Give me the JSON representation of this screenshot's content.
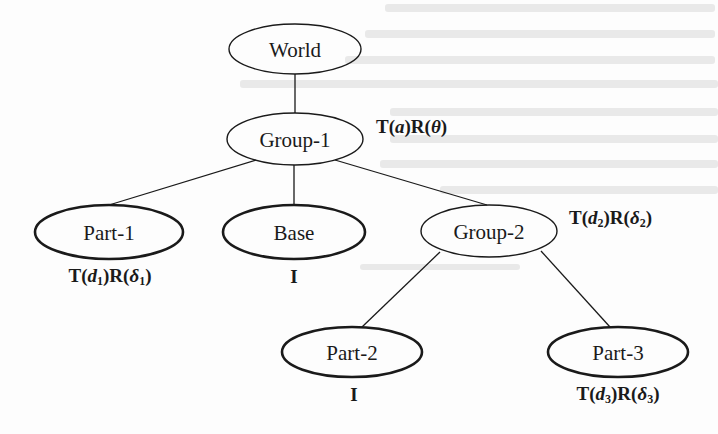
{
  "diagram": {
    "type": "scene-graph-tree",
    "colors": {
      "background": "#fdfdfd",
      "stroke": "#1a1a1a",
      "text": "#1a1a1a"
    },
    "nodes": [
      {
        "id": "world",
        "label": "World",
        "cx": 295,
        "cy": 49,
        "rx": 66,
        "ry": 25,
        "stroke_width": 1.4,
        "kind": "root"
      },
      {
        "id": "group1",
        "label": "Group-1",
        "cx": 295,
        "cy": 139,
        "rx": 68,
        "ry": 26,
        "stroke_width": 1.4,
        "kind": "group"
      },
      {
        "id": "part1",
        "label": "Part-1",
        "cx": 109,
        "cy": 232,
        "rx": 74,
        "ry": 27,
        "stroke_width": 2.6,
        "kind": "leaf"
      },
      {
        "id": "base",
        "label": "Base",
        "cx": 294,
        "cy": 232,
        "rx": 71,
        "ry": 27,
        "stroke_width": 2.6,
        "kind": "leaf"
      },
      {
        "id": "group2",
        "label": "Group-2",
        "cx": 489,
        "cy": 231,
        "rx": 68,
        "ry": 26,
        "stroke_width": 1.4,
        "kind": "group"
      },
      {
        "id": "part2",
        "label": "Part-2",
        "cx": 352,
        "cy": 352,
        "rx": 70,
        "ry": 25,
        "stroke_width": 2.6,
        "kind": "leaf"
      },
      {
        "id": "part3",
        "label": "Part-3",
        "cx": 618,
        "cy": 352,
        "rx": 70,
        "ry": 25,
        "stroke_width": 2.6,
        "kind": "leaf"
      }
    ],
    "edges": [
      {
        "from": "world",
        "to": "group1",
        "x1": 295,
        "y1": 74,
        "x2": 295,
        "y2": 113
      },
      {
        "from": "group1",
        "to": "part1",
        "x1": 256,
        "y1": 160,
        "x2": 109,
        "y2": 205
      },
      {
        "from": "group1",
        "to": "base",
        "x1": 294,
        "y1": 165,
        "x2": 294,
        "y2": 205
      },
      {
        "from": "group1",
        "to": "group2",
        "x1": 335,
        "y1": 160,
        "x2": 487,
        "y2": 205
      },
      {
        "from": "group2",
        "to": "part2",
        "x1": 440,
        "y1": 252,
        "x2": 362,
        "y2": 327
      },
      {
        "from": "group2",
        "to": "part3",
        "x1": 541,
        "y1": 251,
        "x2": 610,
        "y2": 327
      }
    ],
    "transforms": {
      "group1": {
        "text": "T(a)R(θ)",
        "T": "T",
        "T_arg": "a",
        "T_sub": "",
        "R": "R",
        "R_arg": "θ",
        "R_sub": ""
      },
      "part1": {
        "text": "T(d1)R(δ1)",
        "T": "T",
        "T_arg": "d",
        "T_sub": "1",
        "R": "R",
        "R_arg": "δ",
        "R_sub": "1"
      },
      "base": {
        "text": "I"
      },
      "group2": {
        "text": "T(d2)R(δ2)",
        "T": "T",
        "T_arg": "d",
        "T_sub": "2",
        "R": "R",
        "R_arg": "δ",
        "R_sub": "2"
      },
      "part2": {
        "text": "I"
      },
      "part3": {
        "text": "T(d3)R(δ3)",
        "T": "T",
        "T_arg": "d",
        "T_sub": "3",
        "R": "R",
        "R_arg": "δ",
        "R_sub": "3"
      }
    },
    "paren_open": "(",
    "paren_close": ")"
  }
}
